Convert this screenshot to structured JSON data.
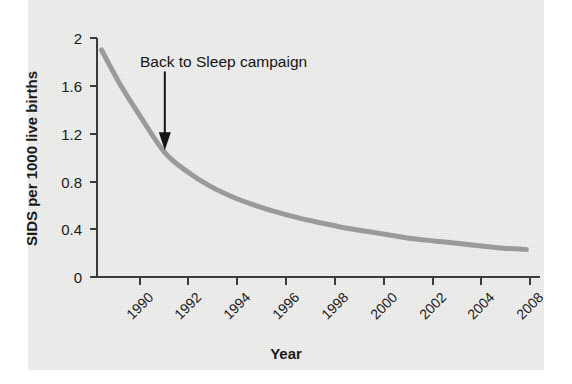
{
  "chart_data": {
    "type": "line",
    "title": "",
    "xlabel": "Year",
    "ylabel": "SIDS per 1000 live births",
    "xlim": [
      1989,
      2008.6
    ],
    "ylim": [
      0,
      2
    ],
    "grid": false,
    "legend": "none",
    "line_color": "#9a9a9a",
    "axis_color": "#3b3b3b",
    "text_color": "#1a1a1a",
    "x_tick_values": [
      1990,
      1992,
      1994,
      1996,
      1998,
      2000,
      2002,
      2004,
      2006,
      2008
    ],
    "x_tick_labels": [
      "1990",
      "1992",
      "1994",
      "1996",
      "1998",
      "2000",
      "2002",
      "2004",
      "",
      "2008"
    ],
    "y_tick_values": [
      0,
      0.4,
      0.8,
      1.2,
      1.6,
      2
    ],
    "y_tick_labels": [
      "0",
      "0.4",
      "0.8",
      "1.2",
      "1.6",
      "2"
    ],
    "series": [
      {
        "name": "SIDS rate",
        "x": [
          1989.2,
          1990,
          1991,
          1992,
          1993,
          1994,
          1995,
          1996,
          1997,
          1998,
          1999,
          2000,
          2001,
          2002,
          2003,
          2004,
          2005,
          2006,
          2007,
          2008
        ],
        "values": [
          1.9,
          1.62,
          1.32,
          1.04,
          0.88,
          0.76,
          0.67,
          0.6,
          0.54,
          0.49,
          0.45,
          0.41,
          0.38,
          0.35,
          0.32,
          0.3,
          0.28,
          0.26,
          0.24,
          0.23
        ]
      }
    ],
    "annotations": [
      {
        "label": "Back to Sleep campaign",
        "arrow_target_year": 1992,
        "arrow_target_value": 1.06,
        "arrow_tail_value": 1.72
      }
    ]
  },
  "axes": {
    "y_title": "SIDS per 1000 live births",
    "x_title": "Year"
  },
  "annotation": {
    "text": "Back to Sleep campaign"
  },
  "ticks": {
    "y": [
      "2",
      "1.6",
      "1.2",
      "0.8",
      "0.4",
      "0"
    ],
    "x": [
      "1990",
      "1992",
      "1994",
      "1996",
      "1998",
      "2000",
      "2002",
      "2004",
      "2008"
    ]
  }
}
